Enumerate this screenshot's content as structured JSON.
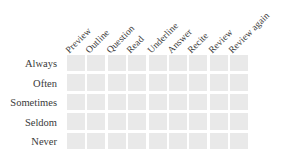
{
  "figure": {
    "type": "survey-response-matrix",
    "background_color": "#ffffff",
    "cell_color": "#e9e9e9",
    "text_color": "#3a3a3a"
  },
  "columns": [
    {
      "label": "Preview"
    },
    {
      "label": "Outline"
    },
    {
      "label": "Question"
    },
    {
      "label": "Read"
    },
    {
      "label": "Underline"
    },
    {
      "label": "Answer"
    },
    {
      "label": "Recite"
    },
    {
      "label": "Review"
    },
    {
      "label": "Review again"
    }
  ],
  "rows": [
    {
      "label": "Always"
    },
    {
      "label": "Often"
    },
    {
      "label": "Sometimes"
    },
    {
      "label": "Seldom"
    },
    {
      "label": "Never"
    }
  ],
  "cells": [
    [
      "",
      "",
      "",
      "",
      "",
      "",
      "",
      "",
      ""
    ],
    [
      "",
      "",
      "",
      "",
      "",
      "",
      "",
      "",
      ""
    ],
    [
      "",
      "",
      "",
      "",
      "",
      "",
      "",
      "",
      ""
    ],
    [
      "",
      "",
      "",
      "",
      "",
      "",
      "",
      "",
      ""
    ],
    [
      "",
      "",
      "",
      "",
      "",
      "",
      "",
      "",
      ""
    ]
  ]
}
